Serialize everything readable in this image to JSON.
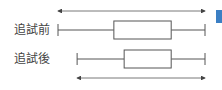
{
  "chart_data": {
    "type": "boxplot",
    "title": "",
    "series": [
      {
        "name": "追試前",
        "min": 0,
        "q1": 0.38,
        "q3": 0.77,
        "max": 1.0
      },
      {
        "name": "追試後",
        "min": 0.13,
        "q1": 0.45,
        "q3": 0.77,
        "max": 1.0
      }
    ],
    "range_arrows": [
      {
        "label": "追試前 range",
        "from": 0,
        "to": 1.0,
        "placement": "top"
      },
      {
        "label": "追試後 range",
        "from": 0.13,
        "to": 1.0,
        "placement": "bottom"
      }
    ],
    "xlim": [
      0,
      1.0
    ]
  },
  "accent_color": "#3b7fc4"
}
